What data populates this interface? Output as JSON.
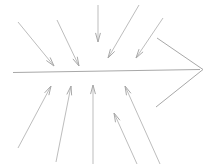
{
  "diagram": {
    "type": "ishikawa-cause-and-effect",
    "canvas": {
      "width": 212,
      "height": 164,
      "background": "#ffffff"
    },
    "style": {
      "stroke_color": "#a8a8a8",
      "stroke_color_light": "#bdbdbd",
      "stroke_width": 1,
      "arrowhead_length": 9,
      "arrowhead_halfangle_deg": 15
    },
    "spine": {
      "label": "spine",
      "x1": 13,
      "y1": 72.5,
      "x2": 200,
      "y2": 69.5
    },
    "head": {
      "label": "effect-head",
      "tip_x": 203,
      "tip_y": 69.5,
      "upper_x": 157,
      "upper_y": 38,
      "lower_x": 156,
      "lower_y": 107
    },
    "upper_bones": [
      {
        "name": "upper-bone-1",
        "x1": 18,
        "y1": 22,
        "x2": 54,
        "y2": 66
      },
      {
        "name": "upper-bone-2",
        "x1": 57,
        "y1": 20,
        "x2": 79,
        "y2": 66
      },
      {
        "name": "upper-bone-3",
        "x1": 98,
        "y1": 5,
        "x2": 98,
        "y2": 42
      },
      {
        "name": "upper-bone-4",
        "x1": 139,
        "y1": 5,
        "x2": 108,
        "y2": 58
      },
      {
        "name": "upper-bone-5",
        "x1": 163,
        "y1": 18,
        "x2": 136,
        "y2": 58
      }
    ],
    "lower_bones": [
      {
        "name": "lower-bone-1",
        "x1": 18,
        "y1": 148,
        "x2": 51,
        "y2": 86
      },
      {
        "name": "lower-bone-2",
        "x1": 56,
        "y1": 162,
        "x2": 71,
        "y2": 86
      },
      {
        "name": "lower-bone-3",
        "x1": 93,
        "y1": 164,
        "x2": 93,
        "y2": 85
      },
      {
        "name": "lower-bone-4",
        "x1": 137,
        "y1": 164,
        "x2": 114,
        "y2": 113
      },
      {
        "name": "lower-bone-5",
        "x1": 160,
        "y1": 164,
        "x2": 125,
        "y2": 86
      }
    ]
  }
}
